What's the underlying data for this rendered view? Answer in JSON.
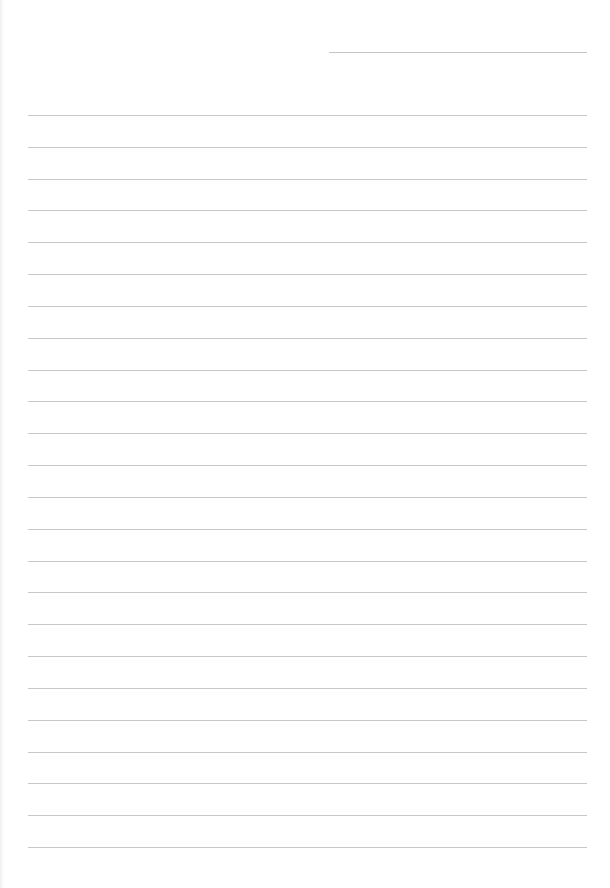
{
  "page": {
    "type": "lined-paper",
    "background_color": "#ffffff",
    "line_color": "#c8c8c8",
    "header_line": {
      "present": true,
      "x": 329,
      "y": 52,
      "width": 258
    },
    "rules": {
      "count": 24,
      "first_y": 115,
      "spacing": 31.83,
      "x": 28,
      "width": 559
    },
    "text": []
  }
}
